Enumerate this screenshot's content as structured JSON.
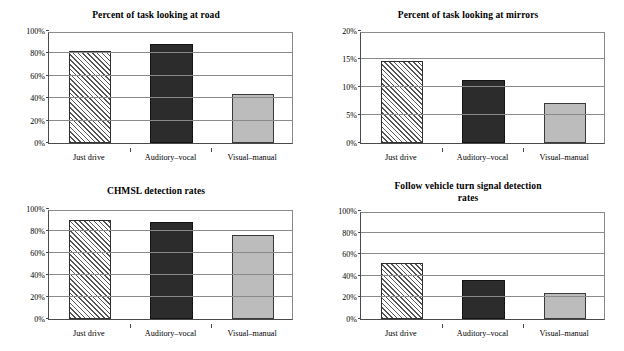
{
  "figure": {
    "background": "#ffffff",
    "width": 624,
    "height": 351,
    "series_colors": {
      "just_drive": "#ffffff",
      "auditory_vocal": "#2c2c2c",
      "visual_manual": "#bcbcbc",
      "axis": "#4a4a4a",
      "grid": "#8a8a8a"
    }
  },
  "chart_data": [
    {
      "type": "bar",
      "title": "Percent of task looking at road",
      "xlabel": "",
      "ylabel": "",
      "categories": [
        "Just drive",
        "Auditory–vocal",
        "Visual–manual"
      ],
      "values": [
        0.825,
        0.885,
        0.44
      ],
      "ylim": [
        0,
        1
      ],
      "yticks": [
        0,
        0.2,
        0.4,
        0.6,
        0.8,
        1
      ],
      "ytick_labels": [
        "0%",
        "20%",
        "40%",
        "60%",
        "80%",
        "100%"
      ],
      "grid": true,
      "legend": "none",
      "bar_styles": [
        "hatch",
        "dark",
        "gray"
      ]
    },
    {
      "type": "bar",
      "title": "Percent of task looking at mirrors",
      "xlabel": "",
      "ylabel": "",
      "categories": [
        "Just drive",
        "Auditory–vocal",
        "Visual–manual"
      ],
      "values": [
        0.147,
        0.113,
        0.072
      ],
      "ylim": [
        0,
        0.2
      ],
      "yticks": [
        0,
        0.05,
        0.1,
        0.15,
        0.2
      ],
      "ytick_labels": [
        "0%",
        "5%",
        "10%",
        "15%",
        "20%"
      ],
      "grid": true,
      "legend": "none",
      "bar_styles": [
        "hatch",
        "dark",
        "gray"
      ]
    },
    {
      "type": "bar",
      "title": "CHMSL detection rates",
      "xlabel": "",
      "ylabel": "",
      "categories": [
        "Just drive",
        "Auditory–vocal",
        "Visual–manual"
      ],
      "values": [
        0.9,
        0.88,
        0.76
      ],
      "ylim": [
        0,
        1
      ],
      "yticks": [
        0,
        0.2,
        0.4,
        0.6,
        0.8,
        1
      ],
      "ytick_labels": [
        "0%",
        "20%",
        "40%",
        "60%",
        "80%",
        "100%"
      ],
      "grid": true,
      "legend": "none",
      "bar_styles": [
        "hatch",
        "dark",
        "gray"
      ]
    },
    {
      "type": "bar",
      "title": "Follow vehicle turn signal detection rates",
      "title_lines": [
        "Follow vehicle turn signal detection",
        "rates"
      ],
      "xlabel": "",
      "ylabel": "",
      "categories": [
        "Just drive",
        "Auditory–vocal",
        "Visual–manual"
      ],
      "values": [
        0.52,
        0.365,
        0.245
      ],
      "ylim": [
        0,
        1
      ],
      "yticks": [
        0,
        0.2,
        0.4,
        0.6,
        0.8,
        1
      ],
      "ytick_labels": [
        "0%",
        "20%",
        "40%",
        "60%",
        "80%",
        "100%"
      ],
      "grid": true,
      "legend": "none",
      "bar_styles": [
        "hatch",
        "dark",
        "gray"
      ]
    }
  ]
}
